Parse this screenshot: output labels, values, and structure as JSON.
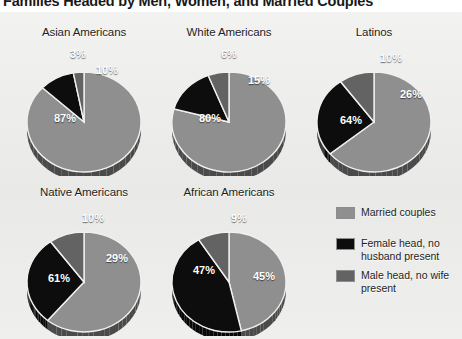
{
  "title": "Families Headed by Men, Women, and Married Couples",
  "colors": {
    "married": "#8f8f8f",
    "female_head": "#0d0d0d",
    "male_head": "#636363",
    "panel_bg": "#ececeb",
    "label_text": "#ffffff"
  },
  "legend": {
    "items": [
      {
        "label": "Married couples",
        "color_key": "married",
        "swatch": "#8f8f8f"
      },
      {
        "label": "Female head, no husband present",
        "color_key": "female_head",
        "swatch": "#0d0d0d"
      },
      {
        "label": "Male head, no wife present",
        "color_key": "male_head",
        "swatch": "#636363"
      }
    ]
  },
  "chart_data": {
    "type": "pie",
    "title": "Families Headed by Men, Women, and Married Couples",
    "legend_position": "right",
    "categories": [
      "Married couples",
      "Female head, no husband present",
      "Male head, no wife present"
    ],
    "units": "percent",
    "charts": [
      {
        "title": "Asian Americans",
        "slices": [
          {
            "label": "Married couples",
            "value": 87,
            "display": "87%"
          },
          {
            "label": "Female head, no husband present",
            "value": 10,
            "display": "10%"
          },
          {
            "label": "Male head, no wife present",
            "value": 3,
            "display": "3%"
          }
        ]
      },
      {
        "title": "White Americans",
        "slices": [
          {
            "label": "Married couples",
            "value": 80,
            "display": "80%"
          },
          {
            "label": "Female head, no husband present",
            "value": 15,
            "display": "15%"
          },
          {
            "label": "Male head, no wife present",
            "value": 6,
            "display": "6%"
          }
        ]
      },
      {
        "title": "Latinos",
        "slices": [
          {
            "label": "Married couples",
            "value": 64,
            "display": "64%"
          },
          {
            "label": "Female head, no husband present",
            "value": 26,
            "display": "26%"
          },
          {
            "label": "Male head, no wife present",
            "value": 10,
            "display": "10%"
          }
        ]
      },
      {
        "title": "Native Americans",
        "slices": [
          {
            "label": "Married couples",
            "value": 61,
            "display": "61%"
          },
          {
            "label": "Female head, no husband present",
            "value": 29,
            "display": "29%"
          },
          {
            "label": "Male head, no wife present",
            "value": 10,
            "display": "10%"
          }
        ]
      },
      {
        "title": "African Americans",
        "slices": [
          {
            "label": "Married couples",
            "value": 47,
            "display": "47%"
          },
          {
            "label": "Female head, no husband present",
            "value": 45,
            "display": "45%"
          },
          {
            "label": "Male head, no wife present",
            "value": 9,
            "display": "9%"
          }
        ]
      }
    ]
  },
  "layout": {
    "cells": [
      {
        "left": 18,
        "top": 26,
        "w": 132,
        "h": 150,
        "cx": 66,
        "cy": 96,
        "rx": 57,
        "ry": 50,
        "depth": 9
      },
      {
        "left": 163,
        "top": 26,
        "w": 132,
        "h": 150,
        "cx": 66,
        "cy": 96,
        "rx": 57,
        "ry": 50,
        "depth": 9
      },
      {
        "left": 308,
        "top": 26,
        "w": 132,
        "h": 150,
        "cx": 66,
        "cy": 96,
        "rx": 57,
        "ry": 50,
        "depth": 9
      },
      {
        "left": 18,
        "top": 186,
        "w": 132,
        "h": 150,
        "cx": 66,
        "cy": 96,
        "rx": 57,
        "ry": 50,
        "depth": 9
      },
      {
        "left": 163,
        "top": 186,
        "w": 132,
        "h": 150,
        "cx": 66,
        "cy": 96,
        "rx": 57,
        "ry": 50,
        "depth": 9
      }
    ],
    "label_positions": [
      [
        {
          "x": 36,
          "y": 86
        },
        {
          "x": 78,
          "y": 38
        },
        {
          "x": 52,
          "y": 22
        }
      ],
      [
        {
          "x": 36,
          "y": 86
        },
        {
          "x": 85,
          "y": 48
        },
        {
          "x": 58,
          "y": 22
        }
      ],
      [
        {
          "x": 32,
          "y": 88
        },
        {
          "x": 92,
          "y": 62
        },
        {
          "x": 72,
          "y": 26
        }
      ],
      [
        {
          "x": 30,
          "y": 86
        },
        {
          "x": 88,
          "y": 66
        },
        {
          "x": 64,
          "y": 26
        }
      ],
      [
        {
          "x": 30,
          "y": 78
        },
        {
          "x": 90,
          "y": 84
        },
        {
          "x": 68,
          "y": 26
        }
      ]
    ]
  }
}
